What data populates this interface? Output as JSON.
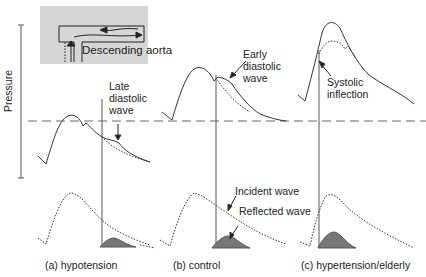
{
  "inset": {
    "label": "Descending aorta",
    "background": "#d6d6d6"
  },
  "axis": {
    "ylabel": "Pressure"
  },
  "annotations": {
    "late_diastolic": [
      "Late",
      "diastolic",
      "wave"
    ],
    "early_diastolic": [
      "Early",
      "diastolic",
      "wave"
    ],
    "systolic_inflection": [
      "Systolic",
      "inflection"
    ],
    "incident_wave": "Incident wave",
    "reflected_wave": "Reflected wave"
  },
  "panels": [
    {
      "caption": "(a) hypotension"
    },
    {
      "caption": "(b) control"
    },
    {
      "caption": "(c) hypertension/elderly"
    }
  ],
  "colors": {
    "line": "#333333",
    "dashed": "#666666",
    "reflected_fill": "#777777"
  }
}
